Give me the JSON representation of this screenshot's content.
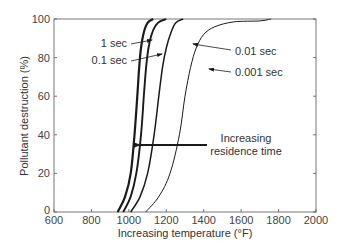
{
  "chart_data": {
    "type": "line",
    "title": "",
    "xlabel": "Increasing temperature (°F)",
    "ylabel": "Pollutant destruction (%)",
    "xlim": [
      600,
      2000
    ],
    "ylim": [
      0,
      100
    ],
    "xticks": [
      600,
      800,
      1000,
      1200,
      1400,
      1600,
      1800,
      2000
    ],
    "yticks": [
      0,
      20,
      40,
      60,
      80,
      100
    ],
    "grid": false,
    "legend": "none (inline annotations)",
    "series": [
      {
        "name": "1 sec",
        "stroke_width": 2.2,
        "x": [
          940,
          980,
          1010,
          1030,
          1045,
          1055,
          1065,
          1080,
          1100,
          1130
        ],
        "y": [
          0,
          8,
          20,
          40,
          60,
          75,
          85,
          93,
          98,
          100
        ]
      },
      {
        "name": "0.1 sec",
        "stroke_width": 1.9,
        "x": [
          970,
          1010,
          1040,
          1065,
          1080,
          1092,
          1105,
          1125,
          1155,
          1200
        ],
        "y": [
          0,
          8,
          20,
          40,
          60,
          75,
          85,
          93,
          98,
          100
        ]
      },
      {
        "name": "0.01 sec",
        "stroke_width": 1.5,
        "x": [
          1010,
          1060,
          1100,
          1135,
          1160,
          1180,
          1200,
          1225,
          1250,
          1290
        ],
        "y": [
          0,
          8,
          20,
          40,
          60,
          75,
          85,
          93,
          98,
          100
        ]
      },
      {
        "name": "0.001 sec",
        "stroke_width": 1.0,
        "x": [
          1090,
          1160,
          1220,
          1270,
          1300,
          1330,
          1360,
          1400,
          1460,
          1560,
          1700,
          1760
        ],
        "y": [
          0,
          8,
          20,
          40,
          60,
          75,
          85,
          92,
          96,
          98.5,
          99,
          100
        ]
      }
    ],
    "annotations": [
      {
        "text": "1 sec",
        "target_series": "1 sec"
      },
      {
        "text": "0.1 sec",
        "target_series": "0.1 sec"
      },
      {
        "text": "0.01 sec",
        "target_series": "0.01 sec"
      },
      {
        "text": "0.001 sec",
        "target_series": "0.001 sec"
      },
      {
        "text": "Increasing residence time",
        "type": "arrow",
        "direction": "left",
        "y": 35,
        "x_from": 1420,
        "x_to": 1045
      }
    ]
  },
  "labels": {
    "xlabel": "Increasing temperature (°F)",
    "ylabel": "Pollutant destruction (%)",
    "arrow_line1": "Increasing",
    "arrow_line2": "residence time",
    "series_1": "1 sec",
    "series_2": "0.1 sec",
    "series_3": "0.01 sec",
    "series_4": "0.001 sec"
  },
  "colors": {
    "line": "#1a1a1a",
    "axis": "#555555",
    "text": "#333333"
  }
}
